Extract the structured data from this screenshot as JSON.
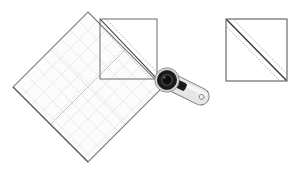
{
  "canvas": {
    "width": 301,
    "height": 174,
    "background": "#ffffff",
    "title": "Quilting instruction diagram: trimming a half-square triangle unit with a rotary cutter and rotated square ruler"
  },
  "palette": {
    "background": "#ffffff",
    "ruler_fill": "#fbfbfb",
    "ruler_edge": "#6e6e6e",
    "ruler_grid": "#c9c9c9",
    "ruler_grid_light": "#dcdcdc",
    "ruler_center_line": "#b4b4b4",
    "fabric_outline": "#6a6a6a",
    "seam_line": "#3b3b3b",
    "stitch_dash": "#8f8f8f",
    "cutter_handle_fill": "#e3e3e3",
    "cutter_handle_edge": "#7a7a7a",
    "cutter_hub_black": "#141414",
    "cutter_hub_ring": "#4a4a4a",
    "cutter_blade_rim": "#d0d0d0",
    "cutter_lever": "#1c1c1c"
  },
  "figures": [
    {
      "id": "ruler",
      "name": "square quilting ruler",
      "shape": "rotated-square",
      "rotation_degrees": 45,
      "center": {
        "x": 88,
        "y": 87
      },
      "half_diagonal": 75,
      "corners": {
        "top": {
          "x": 88,
          "y": 12
        },
        "right": {
          "x": 163,
          "y": 87
        },
        "bottom": {
          "x": 88,
          "y": 162
        },
        "left": {
          "x": 13,
          "y": 87
        }
      },
      "grid": {
        "visible": true,
        "spacing_px": 12.5,
        "orientation": "parallel to ruler edges",
        "center_line": true
      }
    },
    {
      "id": "fabric-square-left",
      "name": "half-square triangle unit under ruler",
      "shape": "square",
      "x": 100,
      "y": 19,
      "width": 57,
      "height": 60,
      "diagonal": {
        "from": "top-left",
        "to": "bottom-right",
        "style": "solid seam with dashed stitch lines on both sides"
      }
    },
    {
      "id": "fabric-square-right",
      "name": "finished half-square triangle unit",
      "shape": "square",
      "x": 226,
      "y": 19,
      "width": 61,
      "height": 62,
      "diagonal": {
        "from": "top-left",
        "to": "bottom-right",
        "style": "solid seam with dotted stitch lines on both sides"
      }
    },
    {
      "id": "rotary-cutter",
      "name": "rotary cutter",
      "blade_center": {
        "x": 167,
        "y": 80
      },
      "blade_radius": 12,
      "handle_angle_degrees": 27,
      "handle_length": 46,
      "handle_end": {
        "x": 206,
        "y": 98
      },
      "handle_hole": {
        "x": 201,
        "y": 96,
        "radius": 2.2
      }
    }
  ],
  "labels": {
    "ruler": "Square ruler",
    "fabric_left": "Pieced square on cutting mat",
    "fabric_right": "Trimmed half-square triangle",
    "cutter": "Rotary cutter"
  },
  "icons": {
    "rotary_cutter": "rotary-cutter-icon",
    "ruler": "square-ruler-icon",
    "fabric": "fabric-square-icon"
  }
}
